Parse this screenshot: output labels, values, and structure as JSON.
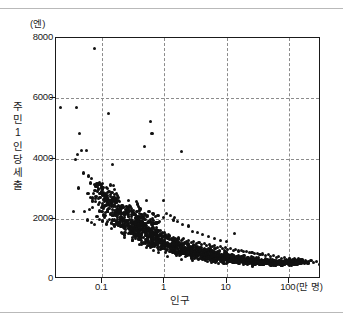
{
  "figure": {
    "axis_title_y_chars": [
      "주",
      "민",
      "1",
      "인",
      "당",
      "세",
      "출"
    ],
    "axis_title_x": "인구",
    "unit_y": "(엔)",
    "unit_x": "(만 명)",
    "y_ticks": [
      "8000",
      "6000",
      "4000",
      "2000",
      "0"
    ],
    "x_ticks": [
      "0.1",
      "1",
      "10",
      "100"
    ],
    "colors": {
      "point": "#111111",
      "axis": "#1a1a1a",
      "grid": "#8c8c8c",
      "rule": "#b9b9b9",
      "background": "#ffffff"
    }
  },
  "chart_data": {
    "type": "scatter",
    "title": "",
    "xlabel": "인구",
    "ylabel": "주민 1인당 세출",
    "xunit": "(만 명)",
    "yunit": "(엔)",
    "xscale": "log",
    "yscale": "linear",
    "xlim": [
      0.018,
      330
    ],
    "ylim": [
      0,
      8000
    ],
    "xticks": [
      0.1,
      1,
      10,
      100
    ],
    "yticks": [
      0,
      2000,
      4000,
      6000,
      8000
    ],
    "grid": true,
    "gridlines_x": [
      0.1,
      1,
      10,
      100
    ],
    "gridlines_y": [
      2000,
      4000,
      6000
    ],
    "legend": null,
    "marker": "filled-circle",
    "point_count_approx": 1700,
    "points": [
      [
        0.021,
        5680
      ],
      [
        0.038,
        5680
      ],
      [
        0.074,
        7640
      ],
      [
        0.125,
        5480
      ],
      [
        0.043,
        4820
      ],
      [
        0.6,
        5240
      ],
      [
        0.63,
        4830
      ],
      [
        0.47,
        4400
      ],
      [
        1.85,
        4220
      ],
      [
        0.047,
        4260
      ],
      [
        0.056,
        4280
      ],
      [
        0.04,
        4120
      ],
      [
        0.037,
        3960
      ],
      [
        0.145,
        3800
      ],
      [
        0.05,
        3520
      ],
      [
        0.06,
        3420
      ],
      [
        0.068,
        3340
      ],
      [
        0.042,
        3020
      ],
      [
        0.098,
        3070
      ],
      [
        0.115,
        3040
      ],
      [
        0.135,
        3120
      ],
      [
        0.105,
        2880
      ],
      [
        0.092,
        2700
      ],
      [
        0.12,
        2760
      ],
      [
        0.155,
        2820
      ],
      [
        0.165,
        2640
      ],
      [
        0.035,
        2240
      ],
      [
        0.052,
        2230
      ],
      [
        0.078,
        2560
      ],
      [
        0.086,
        2480
      ],
      [
        0.07,
        2380
      ],
      [
        0.063,
        2300
      ],
      [
        0.108,
        2420
      ],
      [
        0.128,
        2350
      ],
      [
        0.148,
        2300
      ],
      [
        0.175,
        2420
      ],
      [
        0.195,
        2260
      ],
      [
        0.215,
        2390
      ],
      [
        0.235,
        2310
      ],
      [
        0.26,
        2200
      ],
      [
        0.28,
        2420
      ],
      [
        0.3,
        2260
      ],
      [
        0.33,
        2180
      ],
      [
        0.36,
        2230
      ],
      [
        0.395,
        2280
      ],
      [
        0.43,
        2140
      ],
      [
        0.47,
        2180
      ],
      [
        0.52,
        2620
      ],
      [
        0.58,
        2240
      ],
      [
        0.64,
        2160
      ],
      [
        0.72,
        2080
      ],
      [
        0.8,
        2120
      ],
      [
        0.98,
        2600
      ],
      [
        1.08,
        2180
      ],
      [
        1.25,
        2120
      ],
      [
        1.45,
        2050
      ],
      [
        0.058,
        1960
      ],
      [
        0.066,
        1880
      ],
      [
        0.074,
        1820
      ],
      [
        0.082,
        2060
      ],
      [
        0.09,
        1990
      ],
      [
        0.1,
        1930
      ],
      [
        0.11,
        2040
      ],
      [
        0.12,
        1900
      ],
      [
        0.13,
        1980
      ],
      [
        0.14,
        1860
      ],
      [
        0.15,
        1940
      ],
      [
        0.16,
        1820
      ],
      [
        0.17,
        1900
      ],
      [
        0.18,
        1780
      ],
      [
        0.19,
        1860
      ],
      [
        0.2,
        1740
      ],
      [
        0.21,
        1820
      ],
      [
        0.225,
        1760
      ],
      [
        0.24,
        1700
      ],
      [
        0.255,
        1780
      ],
      [
        0.27,
        1680
      ],
      [
        0.29,
        1740
      ],
      [
        0.31,
        1660
      ],
      [
        0.33,
        1720
      ],
      [
        0.35,
        1620
      ],
      [
        0.375,
        1680
      ],
      [
        0.4,
        1600
      ],
      [
        0.43,
        1650
      ],
      [
        0.46,
        1580
      ],
      [
        0.49,
        1630
      ],
      [
        0.52,
        1540
      ],
      [
        0.56,
        1590
      ],
      [
        0.6,
        1500
      ],
      [
        0.65,
        1560
      ],
      [
        0.7,
        1470
      ],
      [
        0.75,
        1520
      ],
      [
        0.81,
        1440
      ],
      [
        0.87,
        1490
      ],
      [
        0.94,
        1400
      ],
      [
        1.02,
        1450
      ],
      [
        1.1,
        1380
      ],
      [
        1.2,
        1420
      ],
      [
        1.3,
        1340
      ],
      [
        1.42,
        1390
      ],
      [
        1.55,
        1310
      ],
      [
        1.7,
        1360
      ],
      [
        1.85,
        1280
      ],
      [
        2.05,
        1330
      ],
      [
        2.25,
        1250
      ],
      [
        2.45,
        1290
      ],
      [
        2.7,
        1210
      ],
      [
        2.95,
        1250
      ],
      [
        3.25,
        1180
      ],
      [
        3.6,
        1220
      ],
      [
        3.95,
        1150
      ],
      [
        4.35,
        1180
      ],
      [
        4.8,
        1120
      ],
      [
        5.3,
        1150
      ],
      [
        5.85,
        1090
      ],
      [
        6.45,
        1110
      ],
      [
        7.1,
        1050
      ],
      [
        7.85,
        1070
      ],
      [
        8.65,
        1020
      ],
      [
        9.55,
        1040
      ],
      [
        10.5,
        990
      ],
      [
        11.6,
        1010
      ],
      [
        12.8,
        960
      ],
      [
        14.1,
        980
      ],
      [
        15.6,
        930
      ],
      [
        17.2,
        950
      ],
      [
        19.0,
        900
      ],
      [
        21.0,
        920
      ],
      [
        23.2,
        870
      ],
      [
        25.6,
        890
      ],
      [
        28.3,
        840
      ],
      [
        31.2,
        860
      ],
      [
        34.5,
        810
      ],
      [
        38.1,
        830
      ],
      [
        42.1,
        780
      ],
      [
        46.5,
        800
      ],
      [
        51.3,
        750
      ],
      [
        56.7,
        770
      ],
      [
        62.6,
        720
      ],
      [
        69.1,
        740
      ],
      [
        76.3,
        690
      ],
      [
        84.3,
        700
      ],
      [
        93.1,
        660
      ],
      [
        103,
        670
      ],
      [
        114,
        640
      ],
      [
        126,
        650
      ],
      [
        139,
        620
      ],
      [
        153,
        640
      ],
      [
        169,
        600
      ],
      [
        187,
        620
      ],
      [
        207,
        580
      ],
      [
        228,
        600
      ],
      [
        252,
        560
      ],
      [
        278,
        580
      ],
      [
        307,
        480
      ],
      [
        2.85,
        1580
      ],
      [
        3.4,
        1530
      ],
      [
        4.1,
        1480
      ],
      [
        5.1,
        1420
      ],
      [
        6.3,
        1350
      ],
      [
        8.1,
        1290
      ],
      [
        13.5,
        1500
      ],
      [
        9.9,
        1230
      ],
      [
        1.95,
        1820
      ],
      [
        2.4,
        1760
      ],
      [
        1.62,
        1900
      ],
      [
        1.38,
        1960
      ],
      [
        0.95,
        2040
      ],
      [
        0.78,
        2100
      ],
      [
        0.66,
        2160
      ],
      [
        0.55,
        2240
      ]
    ]
  }
}
